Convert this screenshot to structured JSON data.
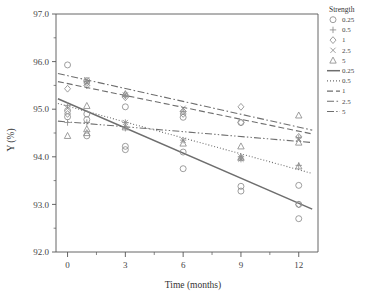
{
  "chart_data": {
    "type": "scatter",
    "title": "",
    "xlabel": "Time (months)",
    "ylabel": "Y (%)",
    "xlim": [
      -0.6,
      13.0
    ],
    "ylim": [
      92.0,
      97.0
    ],
    "xticks": [
      0,
      3,
      6,
      9,
      12
    ],
    "xtick_labels": [
      "0",
      "3",
      "6",
      "9",
      "12"
    ],
    "yticks": [
      92.0,
      93.0,
      94.0,
      95.0,
      96.0,
      97.0
    ],
    "ytick_labels": [
      "92.0",
      "93.0",
      "94.0",
      "95.0",
      "96.0",
      "97.0"
    ],
    "grid": false,
    "legend_position": "right",
    "legend_title": "Strength",
    "legend_marker_entries": [
      {
        "label": "0.25",
        "marker": "circle"
      },
      {
        "label": "0.5",
        "marker": "plus"
      },
      {
        "label": "1",
        "marker": "diamond"
      },
      {
        "label": "2.5",
        "marker": "cross"
      },
      {
        "label": "5",
        "marker": "triangle"
      }
    ],
    "legend_line_entries": [
      {
        "label": "0.25",
        "style": "solid"
      },
      {
        "label": "0.5",
        "style": "dotted"
      },
      {
        "label": "1",
        "style": "dashed"
      },
      {
        "label": "2.5",
        "style": "dash-dot"
      },
      {
        "label": "5",
        "style": "dash-dot-dot"
      }
    ],
    "series": [
      {
        "name": "0.25",
        "marker": "circle",
        "line_style": "solid",
        "fit_line": {
          "x0": -0.5,
          "y0": 95.22,
          "x1": 12.7,
          "y1": 92.9
        },
        "points": [
          {
            "x": 0,
            "y": 95.93
          },
          {
            "x": 0,
            "y": 94.97
          },
          {
            "x": 0,
            "y": 94.84
          },
          {
            "x": 1,
            "y": 95.6
          },
          {
            "x": 1,
            "y": 94.9
          },
          {
            "x": 1,
            "y": 94.78
          },
          {
            "x": 1,
            "y": 94.44
          },
          {
            "x": 3,
            "y": 95.05
          },
          {
            "x": 3,
            "y": 94.22
          },
          {
            "x": 3,
            "y": 94.15
          },
          {
            "x": 6,
            "y": 94.83
          },
          {
            "x": 6,
            "y": 94.1
          },
          {
            "x": 6,
            "y": 93.75
          },
          {
            "x": 9,
            "y": 94.72
          },
          {
            "x": 9,
            "y": 93.38
          },
          {
            "x": 9,
            "y": 93.28
          },
          {
            "x": 12,
            "y": 93.4
          },
          {
            "x": 12,
            "y": 93.0
          },
          {
            "x": 12,
            "y": 92.7
          }
        ]
      },
      {
        "name": "0.5",
        "marker": "plus",
        "line_style": "dotted",
        "fit_line": {
          "x0": -0.5,
          "y0": 95.12,
          "x1": 12.7,
          "y1": 93.65
        },
        "points": [
          {
            "x": 0,
            "y": 95.08
          },
          {
            "x": 0,
            "y": 94.72
          },
          {
            "x": 1,
            "y": 95.58
          },
          {
            "x": 1,
            "y": 94.72
          },
          {
            "x": 3,
            "y": 95.28
          },
          {
            "x": 3,
            "y": 94.72
          },
          {
            "x": 3,
            "y": 94.6
          },
          {
            "x": 6,
            "y": 94.95
          },
          {
            "x": 6,
            "y": 94.35
          },
          {
            "x": 9,
            "y": 94.0
          },
          {
            "x": 9,
            "y": 93.95
          },
          {
            "x": 12,
            "y": 94.4
          },
          {
            "x": 12,
            "y": 93.82
          }
        ]
      },
      {
        "name": "1",
        "marker": "diamond",
        "line_style": "dashed",
        "fit_line": {
          "x0": -0.5,
          "y0": 95.58,
          "x1": 12.7,
          "y1": 94.48
        },
        "points": [
          {
            "x": 0,
            "y": 95.43
          },
          {
            "x": 0,
            "y": 94.9
          },
          {
            "x": 1,
            "y": 95.55
          },
          {
            "x": 1,
            "y": 95.5
          },
          {
            "x": 3,
            "y": 95.3
          },
          {
            "x": 3,
            "y": 95.25
          },
          {
            "x": 6,
            "y": 94.95
          },
          {
            "x": 6,
            "y": 94.9
          },
          {
            "x": 9,
            "y": 95.05
          },
          {
            "x": 9,
            "y": 94.72
          },
          {
            "x": 12,
            "y": 94.42
          },
          {
            "x": 12,
            "y": 93.0
          }
        ]
      },
      {
        "name": "2.5",
        "marker": "cross",
        "line_style": "dash-dot",
        "fit_line": {
          "x0": -0.5,
          "y0": 95.75,
          "x1": 12.7,
          "y1": 94.56
        },
        "points": [
          {
            "x": 0,
            "y": 95.02
          },
          {
            "x": 1,
            "y": 95.62
          },
          {
            "x": 1,
            "y": 95.55
          },
          {
            "x": 3,
            "y": 95.3
          },
          {
            "x": 3,
            "y": 94.72
          },
          {
            "x": 6,
            "y": 95.02
          },
          {
            "x": 6,
            "y": 94.35
          },
          {
            "x": 9,
            "y": 94.0
          },
          {
            "x": 9,
            "y": 93.95
          },
          {
            "x": 12,
            "y": 94.38
          }
        ]
      },
      {
        "name": "5",
        "marker": "triangle",
        "line_style": "dash-dot-dot",
        "fit_line": {
          "x0": -0.5,
          "y0": 94.75,
          "x1": 12.7,
          "y1": 94.3
        },
        "points": [
          {
            "x": 0,
            "y": 94.44
          },
          {
            "x": 1,
            "y": 95.07
          },
          {
            "x": 1,
            "y": 94.58
          },
          {
            "x": 1,
            "y": 94.5
          },
          {
            "x": 3,
            "y": 95.32
          },
          {
            "x": 3,
            "y": 94.62
          },
          {
            "x": 6,
            "y": 94.28
          },
          {
            "x": 9,
            "y": 94.22
          },
          {
            "x": 9,
            "y": 93.98
          },
          {
            "x": 12,
            "y": 94.87
          },
          {
            "x": 12,
            "y": 94.3
          },
          {
            "x": 12,
            "y": 93.8
          }
        ]
      }
    ]
  },
  "colors": {
    "axis": "#555555",
    "marker": "#8c8c8c",
    "line": "#6e6e6e",
    "text": "#3a3a3a",
    "background": "#ffffff"
  }
}
